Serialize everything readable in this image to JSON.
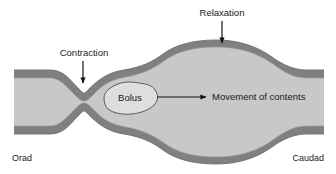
{
  "figure": {
    "background_color": "#ffffff",
    "wall_color": "#808080",
    "wall_dark_edge_color": "#6e6e6e",
    "lumen_color": "#c8c8c8",
    "bolus_fill_color": "#dedede",
    "bolus_outline_color": "#5a5a5a",
    "text_color": "#1a1a1a",
    "arrow_color": "#111111"
  },
  "labels": {
    "relaxation": "Relaxation",
    "contraction": "Contraction",
    "bolus": "Bolus",
    "movement": "Movement of contents",
    "orad": "Orad",
    "caudad": "Caudad"
  },
  "annotations": [
    {
      "name": "relaxation-callout",
      "text": "Relaxation",
      "text_x": 222,
      "text_y": 16,
      "arrow": {
        "type": "vertical-down",
        "x": 222,
        "y1": 21,
        "y2": 43
      }
    },
    {
      "name": "contraction-callout",
      "text": "Contraction",
      "text_x": 84,
      "text_y": 56,
      "arrow": {
        "type": "vertical-down",
        "x": 83,
        "y1": 61,
        "y2": 83
      }
    },
    {
      "name": "movement-callout",
      "text": "Movement of contents",
      "text_x": 212,
      "text_y": 100,
      "arrow": {
        "type": "horizontal-right",
        "y": 97,
        "x1": 157,
        "x2": 206
      }
    },
    {
      "name": "orad-label",
      "text": "Orad",
      "text_x": 12,
      "text_y": 161
    },
    {
      "name": "caudad-label",
      "text": "Caudad",
      "text_x": 276,
      "text_y": 161
    }
  ],
  "geometry": {
    "tube_left_x": 14,
    "tube_right_x": 324,
    "left_lumen_top_y": 76,
    "left_lumen_bottom_y": 114,
    "neck_x": 84,
    "neck_gap_y": 95,
    "relax_bulge_center_x": 222,
    "relax_bulge_top_y": 47,
    "relax_bulge_bottom_y": 143,
    "wall_thickness": 6
  }
}
